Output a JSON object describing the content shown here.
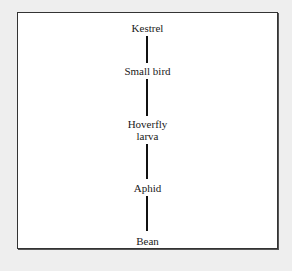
{
  "diagram": {
    "type": "food-chain",
    "orientation": "vertical",
    "nodes": [
      {
        "id": "kestrel",
        "label": "Kestrel"
      },
      {
        "id": "small-bird",
        "label": "Small bird"
      },
      {
        "id": "hoverfly-larva",
        "label_line1": "Hoverfly",
        "label_line2": "larva"
      },
      {
        "id": "aphid",
        "label": "Aphid"
      },
      {
        "id": "bean",
        "label": "Bean"
      }
    ],
    "edges": [
      {
        "from": "kestrel",
        "to": "small-bird"
      },
      {
        "from": "small-bird",
        "to": "hoverfly-larva"
      },
      {
        "from": "hoverfly-larva",
        "to": "aphid"
      },
      {
        "from": "aphid",
        "to": "bean"
      }
    ],
    "colors": {
      "background": "#eeeeee",
      "panel": "#ffffff",
      "lines": "#111111",
      "text": "#1a1a1a"
    }
  }
}
